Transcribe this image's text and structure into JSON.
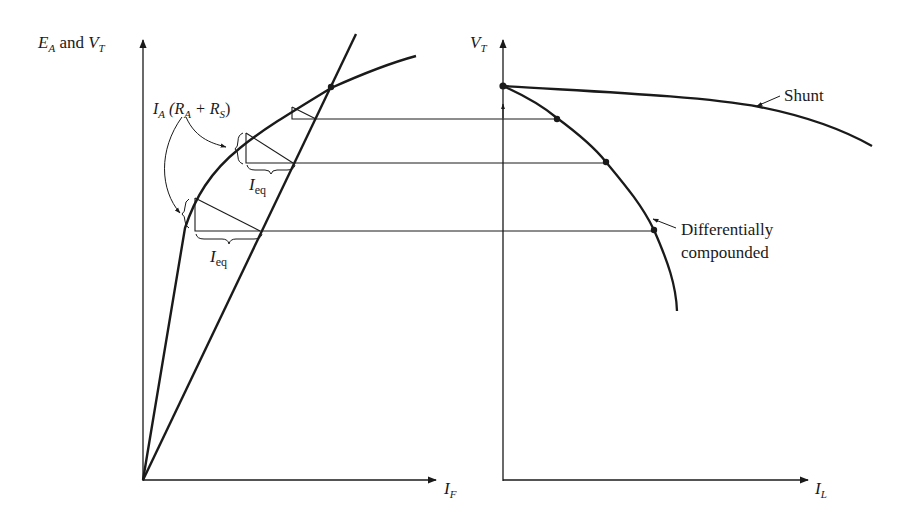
{
  "figure": {
    "left_plot": {
      "y_axis_label": {
        "main": "E",
        "sub": "A",
        "mid": " and ",
        "main2": "V",
        "sub2": "T"
      },
      "x_axis_label": {
        "main": "I",
        "sub": "F"
      },
      "annotation_drop": {
        "text_I": "I",
        "sub_A": "A",
        "open": " (R",
        "sub_A2": "A",
        "plus": " + R",
        "sub_S": "S",
        "close": ")"
      },
      "annotation_ieq_1": {
        "main": "I",
        "sub": "eq"
      },
      "annotation_ieq_2": {
        "main": "I",
        "sub": "eq"
      },
      "curves": [
        "magnetization-curve",
        "field-resistance-line"
      ]
    },
    "right_plot": {
      "y_axis_label": {
        "main": "V",
        "sub": "T"
      },
      "x_axis_label": {
        "main": "I",
        "sub": "L"
      },
      "curve_labels": {
        "shunt": "Shunt",
        "differential_line1": "Differentially",
        "differential_line2": "compounded"
      }
    },
    "colors": {
      "ink": "#1a1a1a",
      "background": "#ffffff"
    }
  }
}
